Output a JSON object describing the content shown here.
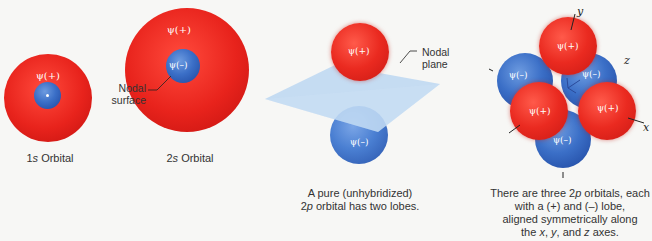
{
  "orbital_1s": {
    "outer_label": "ψ(+)",
    "caption_prefix": "1",
    "caption_italic": "s",
    "caption_suffix": " Orbital"
  },
  "orbital_2s": {
    "outer_label": "ψ(+)",
    "inner_label": "ψ(–)",
    "node_label_line1": "Nodal",
    "node_label_line2": "surface",
    "caption_prefix": "2",
    "caption_italic": "s",
    "caption_suffix": " Orbital"
  },
  "orbital_2p": {
    "top_label": "ψ(+)",
    "bottom_label": "ψ(–)",
    "plane_label_line1": "Nodal",
    "plane_label_line2": "plane",
    "caption_line1": "A pure (unhybridized)",
    "caption_line2_prefix": "2",
    "caption_line2_italic": "p",
    "caption_line2_suffix": " orbital has two lobes."
  },
  "orbitals_3p": {
    "labels": {
      "top": "ψ(+)",
      "back_left": "ψ(–)",
      "back_right": "ψ(–)",
      "front_left": "ψ(+)",
      "front_right": "ψ(+)",
      "bottom": "ψ(–)"
    },
    "axes": {
      "y": "y",
      "z": "z",
      "x": "x"
    },
    "caption_line1_a": "There are three 2",
    "caption_line1_italic": "p",
    "caption_line1_b": " orbitals, each",
    "caption_line2": "with a (+) and (–) lobe,",
    "caption_line3": "aligned symmetrically along",
    "caption_line4_a": "the ",
    "caption_line4_x": "x",
    "caption_line4_b": ", ",
    "caption_line4_y": "y",
    "caption_line4_c": ", and ",
    "caption_line4_z": "z",
    "caption_line4_d": " axes."
  },
  "colors": {
    "positive_lobe": "#e8231c",
    "negative_lobe": "#3b6fc7",
    "nodal_plane": "#b9d6f2"
  }
}
